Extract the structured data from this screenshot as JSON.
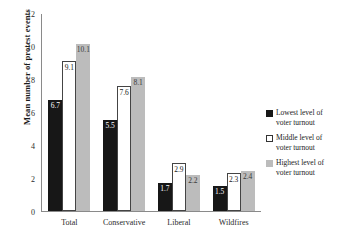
{
  "chart_data": {
    "type": "bar",
    "title": "",
    "xlabel": "",
    "ylabel": "Mean number of protest events",
    "ylim": [
      0,
      12
    ],
    "yticks": [
      0,
      2,
      4,
      6,
      8,
      10,
      12
    ],
    "grid": false,
    "legend_position": "right",
    "categories": [
      "Total",
      "Conservative",
      "Liberal",
      "Wildfires"
    ],
    "series": [
      {
        "name": "Lowest level of voter turnout",
        "color": "#171717",
        "values": [
          6.7,
          5.5,
          1.7,
          1.5
        ],
        "labels": [
          "6.7",
          "5.5",
          "1.7",
          "1.5"
        ]
      },
      {
        "name": "Middle level of voter turnout",
        "color": "#ffffff",
        "values": [
          9.1,
          7.6,
          2.9,
          2.3
        ],
        "labels": [
          "9.1",
          "7.6",
          "2.9",
          "2.3"
        ]
      },
      {
        "name": "Highest level of voter turnout",
        "color": "#bcbcbc",
        "values": [
          10.1,
          8.1,
          2.2,
          2.4
        ],
        "labels": [
          "10.1",
          "8.1",
          "2.2",
          "2.4"
        ]
      }
    ]
  },
  "axis": {
    "y_title": "Mean number of protest events",
    "y_tick_labels": [
      "0",
      "2",
      "4",
      "6",
      "8",
      "10",
      "12"
    ]
  },
  "legend": {
    "items": [
      {
        "label_line1": "Lowest level of",
        "label_line2": "voter turnout",
        "swatch": "black-square-icon"
      },
      {
        "label_line1": "Middle level of",
        "label_line2": "voter turnout",
        "swatch": "white-square-icon"
      },
      {
        "label_line1": "Highest level of",
        "label_line2": "voter turnout",
        "swatch": "gray-square-icon"
      }
    ]
  }
}
